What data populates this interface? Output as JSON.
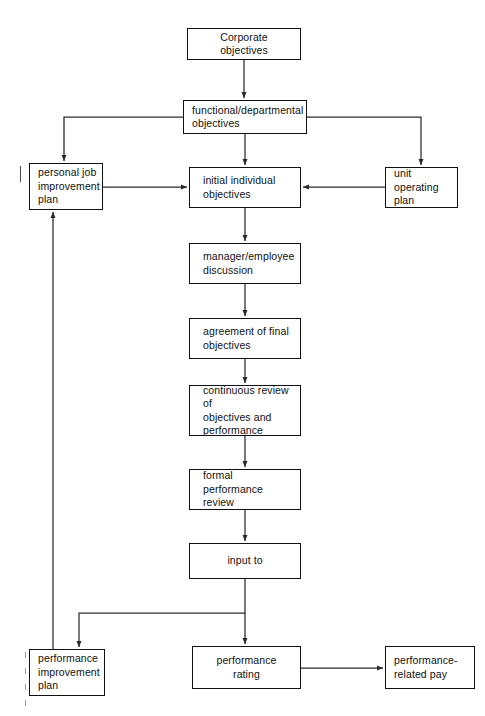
{
  "diagram": {
    "type": "flowchart",
    "canvas": {
      "width": 485,
      "height": 716
    },
    "style": {
      "background_color": "#ffffff",
      "box_border_color": "#111111",
      "connector_color": "#2b2b2b",
      "text_color": "#111111"
    },
    "nodes": [
      {
        "id": "corporate-objectives",
        "label": "Corporate objectives",
        "align": "center",
        "x": 187,
        "y": 28,
        "w": 114,
        "h": 32
      },
      {
        "id": "functional-departmental-objectives",
        "label": "functional/departmental\nobjectives",
        "align": "left",
        "x": 183,
        "y": 100,
        "w": 124,
        "h": 34
      },
      {
        "id": "personal-job-improvement-plan",
        "label": "personal job\nimprovement\nplan",
        "align": "left",
        "x": 29,
        "y": 163,
        "w": 74,
        "h": 47
      },
      {
        "id": "unit-operating-plan",
        "label": "unit operating\nplan",
        "align": "left",
        "x": 385,
        "y": 167,
        "w": 73,
        "h": 41
      },
      {
        "id": "initial-individual-objectives",
        "label": "initial individual\nobjectives",
        "align": "left",
        "x": 189,
        "y": 167,
        "w": 112,
        "h": 41
      },
      {
        "id": "manager-employee-discussion",
        "label": "manager/employee\ndiscussion",
        "align": "left",
        "x": 189,
        "y": 243,
        "w": 112,
        "h": 41
      },
      {
        "id": "agreement-of-final-objectives",
        "label": "agreement of final\nobjectives",
        "align": "left",
        "x": 189,
        "y": 318,
        "w": 112,
        "h": 41
      },
      {
        "id": "continuous-review",
        "label": "continuous review of\nobjectives and\nperformance",
        "align": "left",
        "x": 189,
        "y": 385,
        "w": 112,
        "h": 51
      },
      {
        "id": "formal-performance-review",
        "label": "formal performance\nreview",
        "align": "left",
        "x": 189,
        "y": 469,
        "w": 112,
        "h": 41
      },
      {
        "id": "input-to",
        "label": "input to",
        "align": "center",
        "x": 189,
        "y": 543,
        "w": 112,
        "h": 36
      },
      {
        "id": "performance-improvement-plan",
        "label": "performance\nimprovement\nplan",
        "align": "left",
        "x": 29,
        "y": 649,
        "w": 76,
        "h": 47
      },
      {
        "id": "performance-rating",
        "label": "performance\nrating",
        "align": "center",
        "x": 192,
        "y": 646,
        "w": 109,
        "h": 43
      },
      {
        "id": "performance-related-pay",
        "label": "performance-\nrelated pay",
        "align": "left",
        "x": 385,
        "y": 646,
        "w": 90,
        "h": 43
      }
    ],
    "edges": [
      {
        "id": "corporate-to-functional",
        "from": "corporate-objectives",
        "to": "functional-departmental-objectives",
        "arrow": true
      },
      {
        "id": "functional-to-personal-job-plan",
        "from": "functional-departmental-objectives",
        "to": "personal-job-improvement-plan",
        "arrow": true
      },
      {
        "id": "functional-to-unit-operating-plan",
        "from": "functional-departmental-objectives",
        "to": "unit-operating-plan",
        "arrow": true
      },
      {
        "id": "functional-to-initial-objectives",
        "from": "functional-departmental-objectives",
        "to": "initial-individual-objectives",
        "arrow": true
      },
      {
        "id": "personal-job-plan-to-initial-objectives",
        "from": "personal-job-improvement-plan",
        "to": "initial-individual-objectives",
        "arrow": true
      },
      {
        "id": "unit-operating-plan-to-initial-objectives",
        "from": "unit-operating-plan",
        "to": "initial-individual-objectives",
        "arrow": true
      },
      {
        "id": "initial-objectives-to-discussion",
        "from": "initial-individual-objectives",
        "to": "manager-employee-discussion",
        "arrow": true
      },
      {
        "id": "discussion-to-agreement",
        "from": "manager-employee-discussion",
        "to": "agreement-of-final-objectives",
        "arrow": true
      },
      {
        "id": "agreement-to-continuous-review",
        "from": "agreement-of-final-objectives",
        "to": "continuous-review",
        "arrow": true
      },
      {
        "id": "continuous-review-to-formal-review",
        "from": "continuous-review",
        "to": "formal-performance-review",
        "arrow": true
      },
      {
        "id": "formal-review-to-input-to",
        "from": "formal-performance-review",
        "to": "input-to",
        "arrow": true
      },
      {
        "id": "input-to-to-performance-rating",
        "from": "input-to",
        "to": "performance-rating",
        "arrow": true
      },
      {
        "id": "input-to-to-improvement-plan",
        "from": "input-to",
        "to": "performance-improvement-plan",
        "arrow": true
      },
      {
        "id": "improvement-plan-to-personal-job-plan",
        "from": "performance-improvement-plan",
        "to": "personal-job-improvement-plan",
        "arrow": true
      },
      {
        "id": "rating-to-related-pay",
        "from": "performance-rating",
        "to": "performance-related-pay",
        "arrow": true
      }
    ]
  }
}
